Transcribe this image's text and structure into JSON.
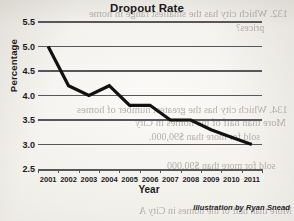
{
  "chart_data": {
    "type": "line",
    "title": "Dropout Rate",
    "xlabel": "Year",
    "ylabel": "Percentage",
    "x": [
      2001,
      2002,
      2003,
      2004,
      2005,
      2006,
      2007,
      2008,
      2009,
      2010,
      2011
    ],
    "categories": [
      "2001",
      "2002",
      "2003",
      "2004",
      "2005",
      "2006",
      "2007",
      "2008",
      "2009",
      "2010",
      "2011"
    ],
    "values": [
      5.0,
      4.2,
      4.0,
      4.2,
      3.8,
      3.8,
      3.5,
      3.5,
      3.3,
      3.15,
      3.0
    ],
    "ylim": [
      2.5,
      5.5
    ],
    "yticks": [
      "5.5",
      "5.0",
      "4.5",
      "4.0",
      "3.5",
      "3.0",
      "2.5"
    ],
    "ytick_values": [
      5.5,
      5.0,
      4.5,
      4.0,
      3.5,
      3.0,
      2.5
    ],
    "xlim": [
      2001,
      2011
    ],
    "grid": true,
    "legend": false,
    "series_color": "#111111",
    "grid_color": "#57565a"
  },
  "attribution": "Illustration by Ryan Snead",
  "bleed_through": {
    "line1_number": "132.",
    "line1": "Which city has the smallest range in home",
    "line2": "prices?",
    "line3_number": "134.",
    "line3": "Which city has the greatest number of homes",
    "line4": "More than half of the homes in City",
    "line5": "sold for more than $90,000.",
    "line6": "sold for more than $90,000",
    "line7": "More than half of the homes in City A"
  }
}
